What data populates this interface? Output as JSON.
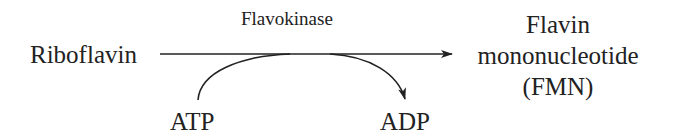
{
  "reaction": {
    "substrate": "Riboflavin",
    "enzyme": "Flavokinase",
    "product": {
      "line1": "Flavin",
      "line2": "mononucleotide",
      "line3": "(FMN)"
    },
    "cofactor_in": "ATP",
    "cofactor_out": "ADP"
  },
  "colors": {
    "text": "#222222",
    "line": "#222222",
    "background": "#ffffff"
  }
}
